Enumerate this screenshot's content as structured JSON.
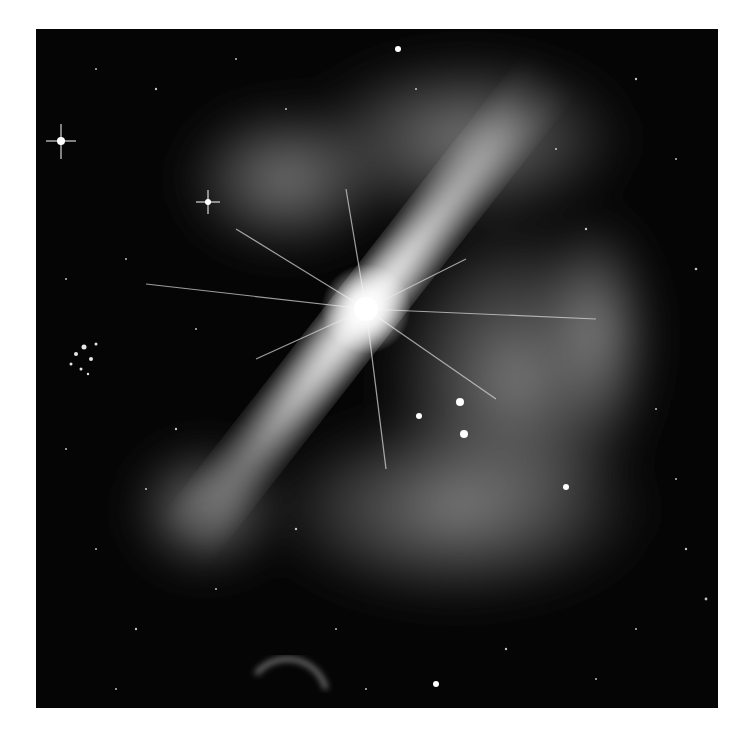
{
  "image": {
    "description": "Grayscale astronomical illustration: bright star at center emitting diagonal bipolar jets and diffraction spikes, surrounded by nebular gas clouds, star clusters, and a dim planet crescent near lower left",
    "palette": {
      "background": "#ffffff",
      "space": "#050505",
      "nebula": "#9a9a9a",
      "core": "#ffffff"
    }
  }
}
